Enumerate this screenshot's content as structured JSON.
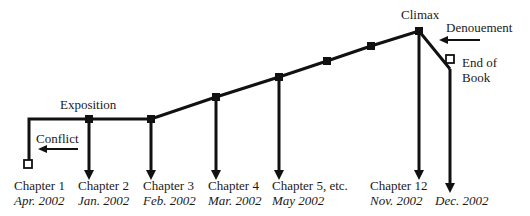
{
  "diagram": {
    "type": "plot-structure-timeline",
    "annotations": {
      "exposition": "Exposition",
      "conflict": "Conflict",
      "climax": "Climax",
      "denouement": "Denouement",
      "end_line1": "End of",
      "end_line2": "Book"
    },
    "chapters": [
      {
        "label": "Chapter 1",
        "date": "Apr. 2002"
      },
      {
        "label": "Chapter 2",
        "date": "Jan. 2002"
      },
      {
        "label": "Chapter 3",
        "date": "Feb. 2002"
      },
      {
        "label": "Chapter 4",
        "date": "Mar. 2002"
      },
      {
        "label": "Chapter 5, etc.",
        "date": "May 2002"
      },
      {
        "label": "Chapter 12",
        "date": "Nov. 2002"
      },
      {
        "label": "",
        "date": "Dec. 2002"
      }
    ],
    "colors": {
      "line": "#111111",
      "background": "#ffffff"
    }
  }
}
